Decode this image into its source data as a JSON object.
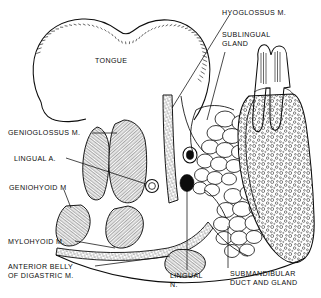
{
  "figure": {
    "background_color": "#ffffff",
    "ink_color": "#0d0d0d"
  },
  "labels": {
    "tongue": "TONGUE",
    "hyoglossus": "HYOGLOSSUS M.",
    "sublingual_gland_line1": "SUBLINGUAL",
    "sublingual_gland_line2": "GLAND",
    "genioglossus": "GENIOGLOSSUS M.",
    "lingual_artery": "LINGUAL A.",
    "geniohyoid": "GENIOHYOID M",
    "mylohyoid": "MYLOHYOID M.",
    "anterior_belly_line1": "ANTERIOR BELLY",
    "anterior_belly_line2": "OF DIGASTRIC M.",
    "lingual_nerve_line1": "LINGUAL",
    "lingual_nerve_line2": "N.",
    "submandibular_line1": "SUBMANDIBULAR",
    "submandibular_line2": "DUCT AND GLAND"
  },
  "structures": [
    {
      "name": "tongue",
      "render": "outline-with-papillae"
    },
    {
      "name": "genioglossus-muscle",
      "render": "hatched-muscle"
    },
    {
      "name": "geniohyoid-muscle",
      "render": "hatched-muscle"
    },
    {
      "name": "hyoglossus-muscle",
      "render": "stippled-band"
    },
    {
      "name": "mylohyoid-muscle",
      "render": "thin-stippled-sling"
    },
    {
      "name": "anterior-belly-digastric",
      "render": "hatched-muscle"
    },
    {
      "name": "sublingual-gland",
      "render": "lobulated-cluster"
    },
    {
      "name": "submandibular-gland",
      "render": "lobulated-cluster"
    },
    {
      "name": "mandible",
      "render": "stippled-bone"
    },
    {
      "name": "molar-tooth",
      "render": "outline-crown-roots"
    },
    {
      "name": "lingual-artery",
      "render": "open-circle"
    },
    {
      "name": "lingual-nerve",
      "render": "solid-oval"
    },
    {
      "name": "submandibular-duct",
      "render": "open-circle"
    }
  ]
}
